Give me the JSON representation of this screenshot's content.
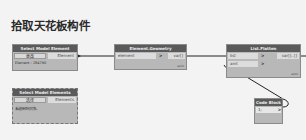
{
  "title": "拾取天花板构件",
  "colors": {
    "canvas": "#f3f3f3",
    "node_body": "#b8b8b8",
    "node_header": "#5a5a5a",
    "port_bg": "#dcdcdc",
    "wire": "#222222"
  },
  "nodes": {
    "select_model_element": {
      "header": "Select Model Element",
      "button_label": "更改",
      "output": "Element",
      "info": "Element : 284790"
    },
    "select_model_elements": {
      "header": "Select Model Elements",
      "button_label": "选择",
      "output": "Elements",
      "info": "未选择任何对象。"
    },
    "element_geometry": {
      "header": "Element.Geometry",
      "input": "element",
      "input_chevron": ">",
      "output": "var[]",
      "footer": "auto"
    },
    "list_flatten": {
      "header": "List.Flatten",
      "inputs": [
        "list",
        "amt"
      ],
      "input_chevrons": [
        ">",
        ">"
      ],
      "output": "var[]..[]",
      "footer": "auto"
    },
    "code_block": {
      "header": "Code Block",
      "line": "1;",
      "output_chevron": ">"
    }
  },
  "wires": [
    {
      "from": "select_model_element.Element",
      "to": "element_geometry.element"
    },
    {
      "from": "element_geometry.var[]",
      "to": "list_flatten.list"
    },
    {
      "from": "code_block.out",
      "to": "list_flatten.amt"
    }
  ]
}
